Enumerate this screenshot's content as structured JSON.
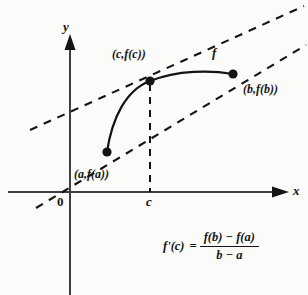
{
  "figure": {
    "background_color": "#fbfbfa",
    "ink_color": "#141414"
  },
  "axes": {
    "y_label": "y",
    "x_label": "x",
    "origin_label": "0",
    "origin_px": [
      70,
      192
    ],
    "x_axis_arrow_end_px": [
      288,
      192
    ],
    "y_axis_arrow_end_px": [
      70,
      38
    ]
  },
  "ticks": [
    {
      "name": "c",
      "label": "c",
      "x_px": 150
    }
  ],
  "points": [
    {
      "name": "point-a",
      "label": "(a,f(a))",
      "x_px": 107,
      "y_px": 152
    },
    {
      "name": "point-c",
      "label": "(c,f(c))",
      "x_px": 150,
      "y_px": 81
    },
    {
      "name": "point-b",
      "label": "(b,f(b))",
      "x_px": 233,
      "y_px": 74
    }
  ],
  "curve": {
    "name": "f",
    "label": "f",
    "stroke_color": "#141414"
  },
  "lines": [
    {
      "name": "tangent-line-at-c",
      "style": "dashed"
    },
    {
      "name": "secant-line-ab",
      "style": "dashed"
    },
    {
      "name": "vertical-drop-at-c",
      "style": "dashed"
    }
  ],
  "formula": {
    "lhs": "f'(c)",
    "equals": "=",
    "numerator": "f(b) − f(a)",
    "denominator": "b − a"
  }
}
